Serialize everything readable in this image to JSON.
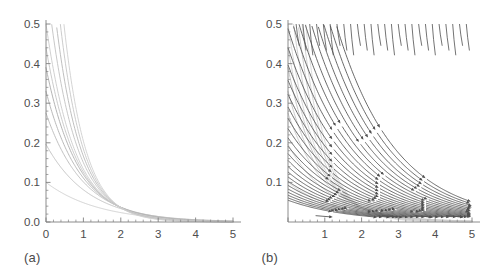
{
  "figure": {
    "panels": [
      {
        "id": "a",
        "label": "(a)",
        "chart_index": 0
      },
      {
        "id": "b",
        "label": "(b)",
        "chart_index": 1
      }
    ]
  },
  "colors": {
    "axis": "#808080",
    "tick_label": "#4d4d4d",
    "panel_label": "#4a4a4a",
    "background_curve_light": "#d8d8d8",
    "background_curve_dark": "#a8a8a8",
    "streamline": "#4f4f4f",
    "page_background": "#ffffff"
  },
  "chart_data": [
    {
      "type": "line",
      "title": "",
      "subtitle": "",
      "xlabel": "",
      "ylabel": "",
      "xlim": [
        0,
        5
      ],
      "ylim": [
        0,
        0.5
      ],
      "grid": false,
      "legend": false,
      "legend_position": "none",
      "x_ticks": [
        0,
        1,
        2,
        3,
        4,
        5
      ],
      "x_tick_labels": [
        "0",
        "1",
        "2",
        "3",
        "4",
        "5"
      ],
      "y_ticks": [
        0.0,
        0.1,
        0.2,
        0.3,
        0.4,
        0.5
      ],
      "y_tick_labels": [
        "0.0",
        "0.1",
        "0.2",
        "0.3",
        "0.4",
        "0.5"
      ],
      "x_minor_tick_count": 4,
      "y_minor_tick_count": 4,
      "annotations": [
        "(a)"
      ],
      "series": [
        {
          "name": "curve-1",
          "y0": 0.1,
          "decay": 0.72,
          "shade": "#cfcfcf"
        },
        {
          "name": "curve-2",
          "y0": 0.196,
          "decay": 0.88,
          "shade": "#c2c2c2"
        },
        {
          "name": "curve-3",
          "y0": 0.275,
          "decay": 1.0,
          "shade": "#bdbdbd"
        },
        {
          "name": "curve-4",
          "y0": 0.33,
          "decay": 1.09,
          "shade": "#b5b5b5"
        },
        {
          "name": "curve-5",
          "y0": 0.39,
          "decay": 1.18,
          "shade": "#b0b0b0"
        },
        {
          "name": "curve-6",
          "y0": 0.44,
          "decay": 1.25,
          "shade": "#c8c8c8"
        },
        {
          "name": "curve-7",
          "y0": 0.5,
          "decay": 1.32,
          "shade": "#cdcdcd"
        },
        {
          "name": "curve-8",
          "y0": 0.62,
          "decay": 1.42,
          "shade": "#c5c5c5"
        },
        {
          "name": "curve-9",
          "y0": 0.76,
          "decay": 1.52,
          "shade": "#bcbcbc"
        },
        {
          "name": "curve-10",
          "y0": 0.93,
          "decay": 1.62,
          "shade": "#c9c9c9"
        },
        {
          "name": "curve-11",
          "y0": 1.14,
          "decay": 1.72,
          "shade": "#d2d2d2"
        }
      ],
      "description": "Family of monotonically decreasing decay curves from the vertical axis toward zero at large x."
    },
    {
      "type": "line",
      "title": "",
      "subtitle": "",
      "xlabel": "",
      "ylabel": "",
      "xlim": [
        0,
        5
      ],
      "ylim": [
        0,
        0.5
      ],
      "grid": false,
      "legend": false,
      "legend_position": "none",
      "x_ticks": [
        0,
        1,
        2,
        3,
        4,
        5
      ],
      "x_tick_labels": [
        "",
        "1",
        "2",
        "3",
        "4",
        "5"
      ],
      "y_ticks": [
        0.1,
        0.2,
        0.3,
        0.4,
        0.5
      ],
      "y_tick_labels": [
        "0.1",
        "0.2",
        "0.3",
        "0.4",
        "0.5"
      ],
      "x_minor_tick_count": 4,
      "y_minor_tick_count": 4,
      "annotations": [
        "(b)"
      ],
      "has_arrowheads": true,
      "arrow_direction": "down-right",
      "background_series": [
        {
          "name": "bg-curve-1",
          "y0": 0.1,
          "decay": 0.72,
          "shade": "#d6d6d6"
        },
        {
          "name": "bg-curve-2",
          "y0": 0.196,
          "decay": 0.88,
          "shade": "#d0d0d0"
        },
        {
          "name": "bg-curve-3",
          "y0": 0.275,
          "decay": 1.0,
          "shade": "#cccccc"
        },
        {
          "name": "bg-curve-4",
          "y0": 0.33,
          "decay": 1.09,
          "shade": "#c8c8c8"
        },
        {
          "name": "bg-curve-5",
          "y0": 0.39,
          "decay": 1.18,
          "shade": "#c4c4c4"
        },
        {
          "name": "bg-curve-6",
          "y0": 0.44,
          "decay": 1.25,
          "shade": "#d2d2d2"
        },
        {
          "name": "bg-curve-7",
          "y0": 0.5,
          "decay": 1.32,
          "shade": "#d6d6d6"
        },
        {
          "name": "bg-curve-8",
          "y0": 0.62,
          "decay": 1.42,
          "shade": "#cfcfcf"
        },
        {
          "name": "bg-curve-9",
          "y0": 0.76,
          "decay": 1.52,
          "shade": "#c9c9c9"
        },
        {
          "name": "bg-curve-10",
          "y0": 0.93,
          "decay": 1.62,
          "shade": "#d4d4d4"
        },
        {
          "name": "bg-curve-11",
          "y0": 1.14,
          "decay": 1.72,
          "shade": "#dadada"
        }
      ],
      "streamline_start_x": [
        0.0,
        0.0,
        0.0,
        0.0,
        0.0,
        0.0,
        0.22,
        0.62,
        1.02,
        1.42,
        1.82,
        2.22,
        2.62,
        3.02,
        3.42,
        3.82,
        4.22,
        4.62
      ],
      "streamline_count": 30,
      "description": "Same decay-curve family shown in light gray, overlaid with darker streamline trajectories carrying arrowheads that point down and to the right, indicating flow direction of the vector field."
    }
  ]
}
